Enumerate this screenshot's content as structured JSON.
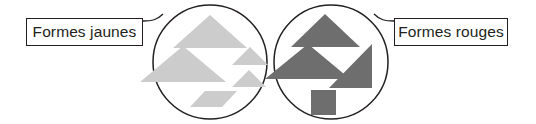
{
  "canvas": {
    "width": 536,
    "height": 124,
    "background": "#ffffff"
  },
  "colors": {
    "stroke": "#231f20",
    "yellow_shape_fill": "#cccccc",
    "red_shape_fill": "#6e6e6e",
    "box_border": "#231f20",
    "text": "#231f20",
    "background": "#ffffff"
  },
  "labels": {
    "yellow": {
      "text": "Formes jaunes"
    },
    "red": {
      "text": "Formes rouges"
    }
  },
  "groups": [
    {
      "id": "yellow-group",
      "label_key": "yellow",
      "fill": "#cccccc",
      "circle": {
        "cx": 210,
        "cy": 62,
        "r": 57
      },
      "shapes": [
        {
          "name": "triangle-large-top",
          "type": "triangle",
          "points": "210,15 247,48 173,48"
        },
        {
          "name": "triangle-large-middle-left",
          "type": "triangle",
          "points": "183,46 226,82 140,82"
        },
        {
          "name": "triangle-small-upper-right",
          "type": "triangle",
          "points": "250,47 268,65 232,65"
        },
        {
          "name": "triangle-small-lower-right",
          "type": "triangle",
          "points": "249,70 266,87 232,87"
        },
        {
          "name": "parallelogram-bottom",
          "type": "parallelogram",
          "points": "205,91 237,91 222,107 190,107"
        }
      ]
    },
    {
      "id": "red-group",
      "label_key": "red",
      "fill": "#6e6e6e",
      "circle": {
        "cx": 331,
        "cy": 62,
        "r": 57
      },
      "shapes": [
        {
          "name": "triangle-large-top",
          "type": "triangle",
          "points": "325,14 360,47 291,47"
        },
        {
          "name": "triangle-large-middle-left",
          "type": "triangle",
          "points": "308,44 350,79 265,79"
        },
        {
          "name": "right-triangle-right",
          "type": "right-triangle",
          "points": "372,44 372,88 329,88"
        },
        {
          "name": "square-bottom",
          "type": "square",
          "x": 311,
          "y": 90,
          "width": 25,
          "height": 25
        }
      ]
    }
  ],
  "connectors": [
    {
      "name": "connector-yellow",
      "path": "M 143 21 C 152 21 157 20 163 14"
    },
    {
      "name": "connector-red",
      "path": "M 394 21 C 385 21 380 20 374 14"
    }
  ],
  "icon_names": [
    "triangle-icon",
    "parallelogram-icon",
    "square-icon",
    "circle-outline-icon"
  ]
}
